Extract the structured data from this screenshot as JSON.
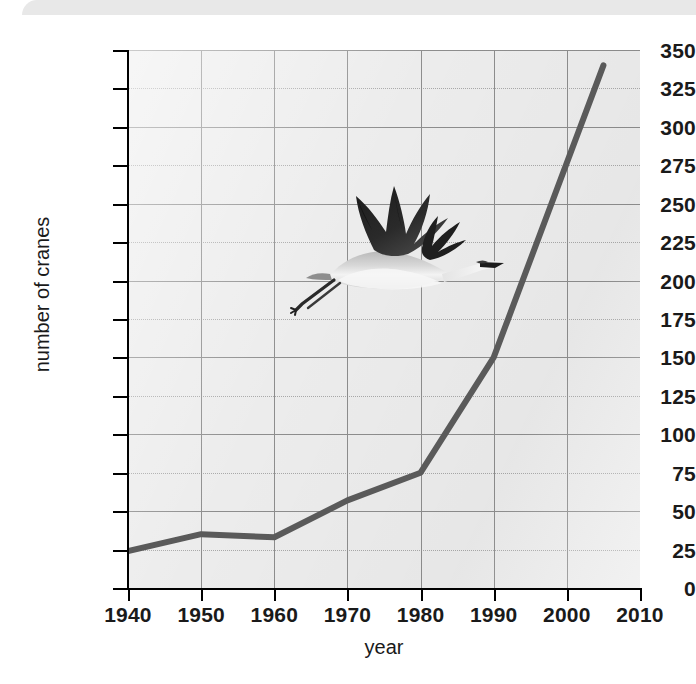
{
  "figure": {
    "kind": "line-graph-with-photo",
    "photo_caption": "whooping crane in flight"
  },
  "chart_data": {
    "type": "line",
    "title": "",
    "subtitle": "",
    "xlabel": "year",
    "ylabel": "number of cranes",
    "xlim": [
      1940,
      2010
    ],
    "ylim": [
      0,
      350
    ],
    "xticks": [
      1940,
      1950,
      1960,
      1970,
      1980,
      1990,
      2000,
      2010
    ],
    "yticks": [
      0,
      25,
      50,
      75,
      100,
      125,
      150,
      175,
      200,
      225,
      250,
      275,
      300,
      325,
      350
    ],
    "ytick_major": [
      0,
      50,
      100,
      150,
      200,
      250,
      300,
      350
    ],
    "ytick_minor": [
      25,
      75,
      125,
      175,
      225,
      275,
      325
    ],
    "grid": "both-axes",
    "legend": "none",
    "line_color": "#5a5a5a",
    "plot_background": "#ececec",
    "x": [
      1940,
      1950,
      1960,
      1970,
      1980,
      1990,
      2005
    ],
    "values": [
      24,
      35,
      33,
      57,
      75,
      150,
      340
    ],
    "series": [
      {
        "name": "number of cranes",
        "points": [
          {
            "year": 1940,
            "cranes": 24
          },
          {
            "year": 1950,
            "cranes": 35
          },
          {
            "year": 1960,
            "cranes": 33
          },
          {
            "year": 1970,
            "cranes": 57
          },
          {
            "year": 1980,
            "cranes": 75
          },
          {
            "year": 1990,
            "cranes": 150
          },
          {
            "year": 2005,
            "cranes": 340
          }
        ]
      }
    ],
    "annotations": [
      {
        "type": "image",
        "content": "whooping crane in flight",
        "x_range": [
          1946,
          1975
        ],
        "y_range": [
          185,
          290
        ]
      }
    ]
  }
}
